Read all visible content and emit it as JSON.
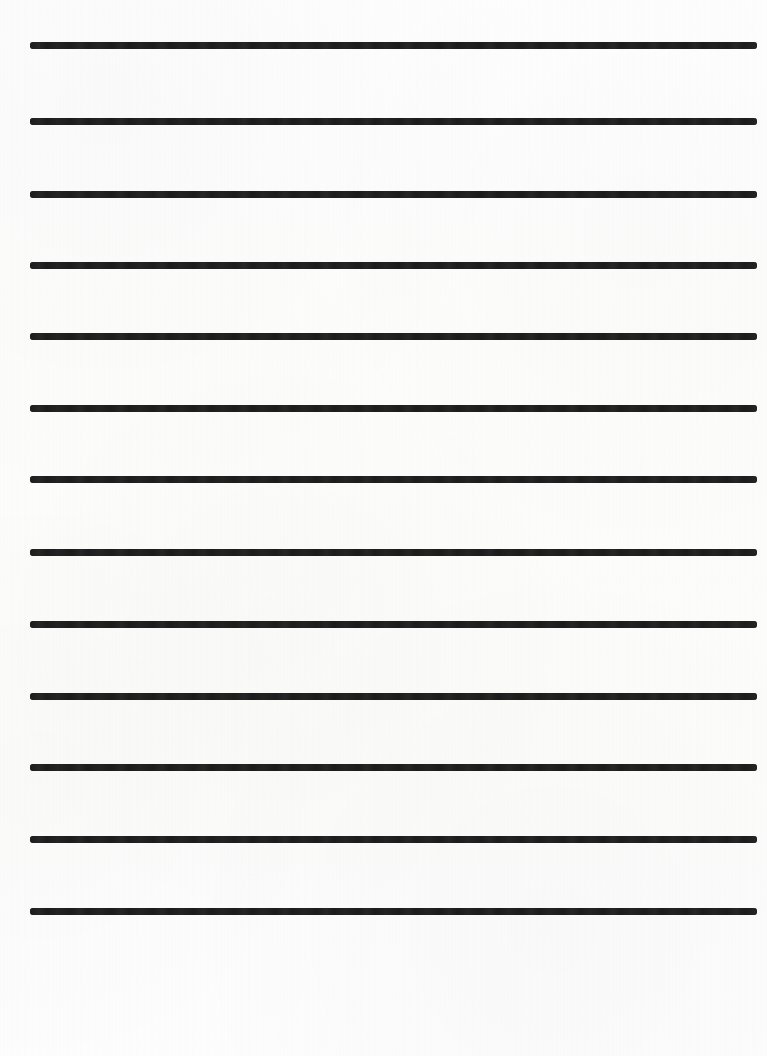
{
  "page": {
    "width": 767,
    "height": 1056,
    "background_color": "#fdfdfc",
    "orientation": "portrait"
  },
  "ruling": {
    "line_color": "#1c1c1c",
    "line_count": 13,
    "line_thickness": 7,
    "line_left": 30,
    "line_width": 727,
    "line_spacing": 71.5,
    "first_line_center_y": 45,
    "last_line_center_y": 981,
    "top_margin": 42,
    "bottom_margin": 72,
    "cap_style": "rounded"
  },
  "lines": [
    {
      "index": 1,
      "center_y": 45,
      "label": "writing-line-1"
    },
    {
      "index": 2,
      "center_y": 121,
      "label": "writing-line-2"
    },
    {
      "index": 3,
      "center_y": 194,
      "label": "writing-line-3"
    },
    {
      "index": 4,
      "center_y": 265,
      "label": "writing-line-4"
    },
    {
      "index": 5,
      "center_y": 336,
      "label": "writing-line-5"
    },
    {
      "index": 6,
      "center_y": 408,
      "label": "writing-line-6"
    },
    {
      "index": 7,
      "center_y": 479,
      "label": "writing-line-7"
    },
    {
      "index": 8,
      "center_y": 552,
      "label": "writing-line-8"
    },
    {
      "index": 9,
      "center_y": 624,
      "label": "writing-line-9"
    },
    {
      "index": 10,
      "center_y": 696,
      "label": "writing-line-10"
    },
    {
      "index": 11,
      "center_y": 767,
      "label": "writing-line-11"
    },
    {
      "index": 12,
      "center_y": 839,
      "label": "writing-line-12"
    },
    {
      "index": 13,
      "center_y": 911,
      "label": "writing-line-13"
    },
    {
      "index": 14,
      "center_y": 981,
      "label": "writing-line-14"
    }
  ],
  "content": {
    "text": "",
    "has_handwriting": false,
    "has_header": false,
    "has_margin_rule": false
  }
}
